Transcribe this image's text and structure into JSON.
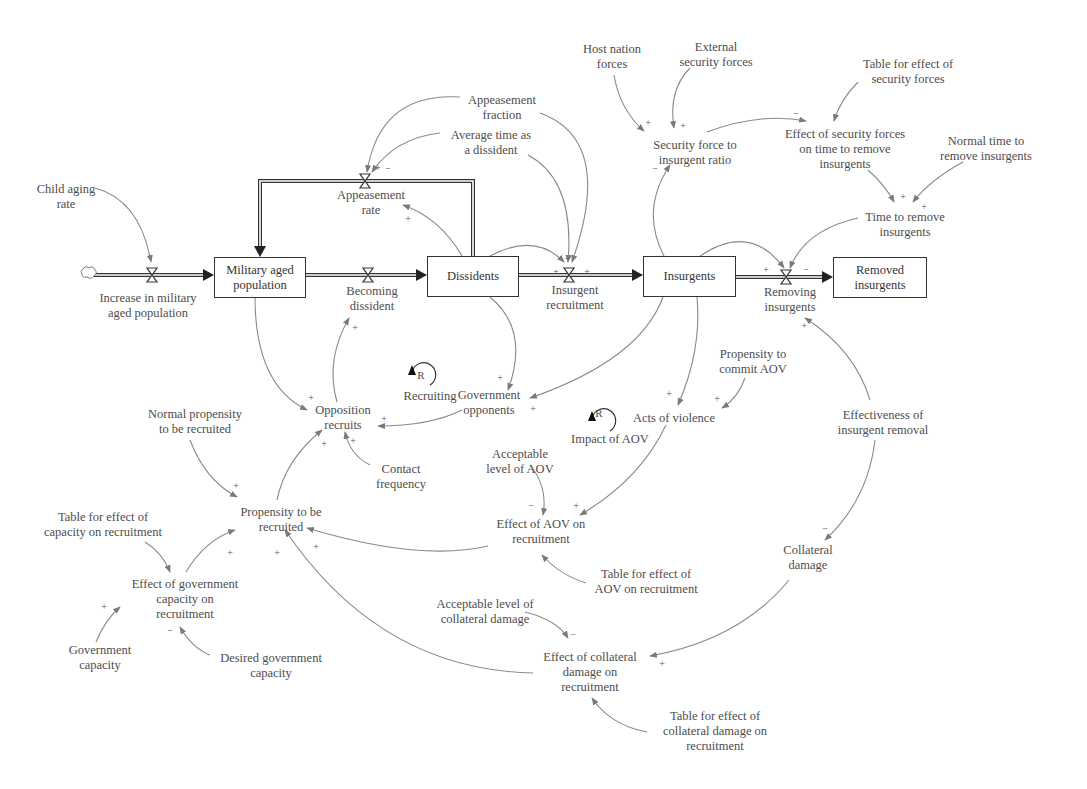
{
  "diagram": {
    "type": "stock-and-flow / causal loop diagram",
    "stocks": [
      {
        "id": "military_aged_population",
        "label": "Military aged\npopulation"
      },
      {
        "id": "dissidents",
        "label": "Dissidents"
      },
      {
        "id": "insurgents",
        "label": "Insurgents"
      },
      {
        "id": "removed_insurgents",
        "label": "Removed\ninsurgents"
      }
    ],
    "flows": [
      {
        "id": "increase_military_aged",
        "label": "Increase in military\naged population"
      },
      {
        "id": "becoming_dissident",
        "label": "Becoming\ndissident"
      },
      {
        "id": "appeasement_rate",
        "label": "Appeasement\nrate"
      },
      {
        "id": "insurgent_recruitment",
        "label": "Insurgent\nrecruitment"
      },
      {
        "id": "removing_insurgents",
        "label": "Removing\ninsurgents"
      }
    ],
    "variables": [
      {
        "id": "child_aging_rate",
        "label": "Child aging\nrate"
      },
      {
        "id": "appeasement_fraction",
        "label": "Appeasement\nfraction"
      },
      {
        "id": "avg_time_dissident",
        "label": "Average time as\na dissident"
      },
      {
        "id": "host_nation_forces",
        "label": "Host nation\nforces"
      },
      {
        "id": "external_security_forces",
        "label": "External\nsecurity forces"
      },
      {
        "id": "table_effect_security",
        "label": "Table for effect of\nsecurity forces"
      },
      {
        "id": "security_force_ratio",
        "label": "Security force to\ninsurgent ratio"
      },
      {
        "id": "effect_security_forces",
        "label": "Effect of security forces\non time to remove\ninsurgents"
      },
      {
        "id": "normal_time_remove",
        "label": "Normal time to\nremove insurgents"
      },
      {
        "id": "time_to_remove",
        "label": "Time to remove\ninsurgents"
      },
      {
        "id": "government_opponents",
        "label": "Government\nopponents"
      },
      {
        "id": "opposition_recruits",
        "label": "Opposition\nrecruits"
      },
      {
        "id": "contact_frequency",
        "label": "Contact\nfrequency"
      },
      {
        "id": "normal_propensity",
        "label": "Normal propensity\nto be recruited"
      },
      {
        "id": "propensity_recruited",
        "label": "Propensity to be\nrecruited"
      },
      {
        "id": "table_capacity",
        "label": "Table for effect of\ncapacity on recruitment"
      },
      {
        "id": "effect_gov_capacity",
        "label": "Effect of government\ncapacity on\nrecruitment"
      },
      {
        "id": "government_capacity",
        "label": "Government\ncapacity"
      },
      {
        "id": "desired_gov_capacity",
        "label": "Desired government\ncapacity"
      },
      {
        "id": "propensity_aov",
        "label": "Propensity to\ncommit AOV"
      },
      {
        "id": "acts_of_violence",
        "label": "Acts of violence"
      },
      {
        "id": "acceptable_aov",
        "label": "Acceptable\nlevel of AOV"
      },
      {
        "id": "effect_aov",
        "label": "Effect of AOV on\nrecruitment"
      },
      {
        "id": "table_aov",
        "label": "Table for effect of\nAOV on recruitment"
      },
      {
        "id": "effectiveness_removal",
        "label": "Effectiveness of\ninsurgent removal"
      },
      {
        "id": "collateral_damage",
        "label": "Collateral\ndamage"
      },
      {
        "id": "acceptable_collateral",
        "label": "Acceptable level of\ncollateral damage"
      },
      {
        "id": "effect_collateral",
        "label": "Effect of collateral\ndamage on\nrecruitment"
      },
      {
        "id": "table_collateral",
        "label": "Table for effect of\ncollateral damage on\nrecruitment"
      }
    ],
    "loops": [
      {
        "id": "recruiting",
        "symbol": "R",
        "label": "Recruiting"
      },
      {
        "id": "impact_aov",
        "symbol": "R",
        "label": "Impact of AOV"
      }
    ],
    "polarity": {
      "plus": "+",
      "minus": "−"
    }
  }
}
